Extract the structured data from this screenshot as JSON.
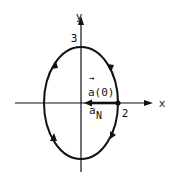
{
  "diagram": {
    "type": "ellipse-motion",
    "axes": {
      "x_label": "x",
      "y_label": "y"
    },
    "ticks": {
      "x_tick": "2",
      "y_tick": "3"
    },
    "ellipse": {
      "semi_axis_x": 2,
      "semi_axis_y": 3,
      "direction": "clockwise"
    },
    "vectors": {
      "a0_arrow": "→",
      "a0_label": "a(0)",
      "aN_main": "a",
      "aN_sub": "N"
    },
    "colors": {
      "stroke": "#111111",
      "background": "#ffffff"
    }
  }
}
